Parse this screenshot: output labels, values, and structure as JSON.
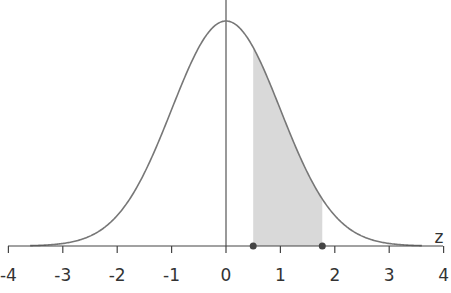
{
  "chart_data": {
    "type": "area",
    "title": "",
    "xlabel": "z",
    "ylabel": "",
    "xlim": [
      -4,
      4
    ],
    "x_ticks": [
      -4,
      -3,
      -2,
      -1,
      0,
      1,
      2,
      3,
      4
    ],
    "x_tick_labels": [
      "-4",
      "-3",
      "-2",
      "-1",
      "0",
      "1",
      "2",
      "3",
      "4"
    ],
    "grid": false,
    "legend": null,
    "series": [
      {
        "name": "standard normal density",
        "mean": 0,
        "sd": 1
      }
    ],
    "shaded_region": {
      "from": 0.5,
      "to": 1.77
    },
    "markers": [
      0.5,
      1.77
    ],
    "colors": {
      "curve": "#777777",
      "axis": "#444444",
      "shade": "#d9d9d9",
      "marker": "#444444"
    }
  }
}
